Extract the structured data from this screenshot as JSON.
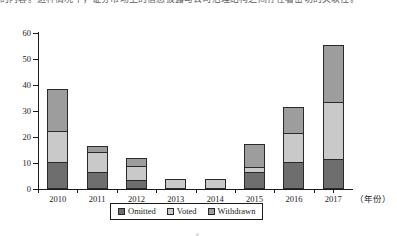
{
  "page": {
    "top_cut_text": "的内容。这种情况下，证券市场上的信息披露与公司治理结构之间存在着密切的关联性。"
  },
  "chart_data": {
    "type": "bar",
    "stacked": true,
    "title": "",
    "xlabel": "（年份）",
    "ylabel": "",
    "categories": [
      "2010",
      "2011",
      "2012",
      "2013",
      "2014",
      "2015",
      "2016",
      "2017"
    ],
    "series": [
      {
        "name": "Omitted",
        "color": "#6e6e6e",
        "values": [
          10,
          6,
          3,
          0,
          0,
          6,
          10,
          11
        ]
      },
      {
        "name": "Voted",
        "color": "#c9c9c9",
        "values": [
          12,
          8,
          5.5,
          3.5,
          3.5,
          2,
          11,
          22
        ]
      },
      {
        "name": "Withdrawn",
        "color": "#9d9d9d",
        "values": [
          16,
          2,
          3,
          0,
          0,
          9,
          10,
          22
        ]
      }
    ],
    "totals": [
      38,
      16,
      11.5,
      3.5,
      3.5,
      17,
      31,
      55
    ],
    "ylim": [
      0,
      60
    ],
    "yticks": [
      0,
      10,
      20,
      30,
      40,
      50,
      60
    ],
    "ytick_labels": [
      "0",
      "10",
      "20",
      "30",
      "40",
      "50",
      "60"
    ],
    "grid": false,
    "legend_position": "bottom",
    "legend_entries": [
      "Omitted",
      "Voted",
      "Withdrawn"
    ]
  }
}
